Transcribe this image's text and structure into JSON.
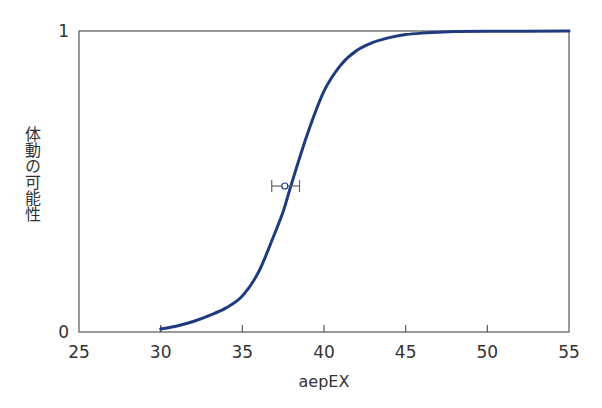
{
  "chart_data": {
    "type": "line",
    "title": "",
    "xlabel": "aepEX",
    "ylabel": "体動の可能性",
    "xlim": [
      25,
      55
    ],
    "ylim": [
      0,
      1
    ],
    "xticks": [
      "25",
      "30",
      "35",
      "40",
      "45",
      "50",
      "55"
    ],
    "yticks": [
      "0",
      "1"
    ],
    "grid": false,
    "legend": null,
    "series": [
      {
        "name": "probability curve",
        "color": "#1f3a7d",
        "x": [
          30,
          31,
          32,
          33,
          34,
          35,
          36,
          37,
          37.5,
          38,
          39,
          40,
          41,
          42,
          43,
          44,
          45,
          46,
          47,
          48,
          50,
          55
        ],
        "y": [
          0.01,
          0.02,
          0.035,
          0.055,
          0.08,
          0.12,
          0.2,
          0.33,
          0.4,
          0.49,
          0.66,
          0.8,
          0.885,
          0.935,
          0.962,
          0.978,
          0.988,
          0.993,
          0.996,
          0.998,
          0.999,
          1.0
        ]
      }
    ],
    "annotations": [
      {
        "type": "errorbar",
        "x": 37.6,
        "y": 0.485,
        "xerr_low": 36.8,
        "xerr_high": 38.5,
        "marker": "open-circle"
      }
    ]
  }
}
